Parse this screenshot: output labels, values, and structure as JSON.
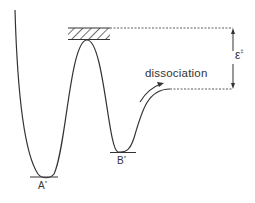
{
  "diagram": {
    "type": "potential-energy-curve",
    "labels": {
      "well_a": "A",
      "well_a_sup": "*",
      "well_b": "B",
      "well_b_sup": "*",
      "process": "dissociation",
      "barrier_energy": "ε",
      "barrier_energy_sup": "‡"
    },
    "colors": {
      "line": "#333333",
      "background": "#ffffff"
    }
  }
}
